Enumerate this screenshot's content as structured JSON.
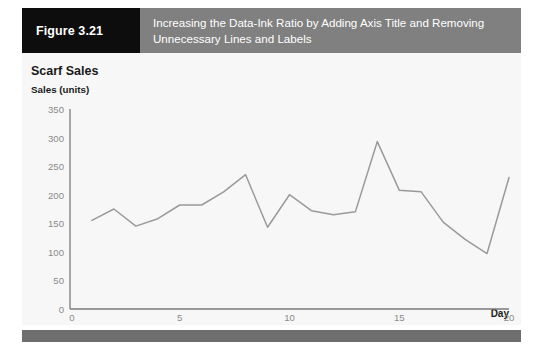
{
  "figure": {
    "number_label": "Figure 3.21",
    "caption": "Increasing the Data-Ink Ratio by Adding Axis Title and Removing Unnecessary Lines and Labels"
  },
  "colors": {
    "figure_number_bg": "#0d0d0d",
    "caption_bg": "#808080",
    "caption_text": "#ffffff",
    "panel_bg": "#f7f7f7",
    "line_series": "#9a9a9a",
    "axis": "#7a7a7a",
    "tick_text": "#8a8a8a",
    "footer_bar": "#6e6e6e"
  },
  "chart_data": {
    "type": "line",
    "title": "Scarf Sales",
    "xlabel": "Day",
    "ylabel": "Sales (units)",
    "x": [
      1,
      2,
      3,
      4,
      5,
      6,
      7,
      8,
      9,
      10,
      11,
      12,
      13,
      14,
      15,
      16,
      17,
      18,
      19,
      20
    ],
    "values": [
      155,
      175,
      145,
      158,
      182,
      182,
      205,
      235,
      143,
      200,
      172,
      165,
      170,
      293,
      208,
      205,
      152,
      122,
      97,
      230
    ],
    "series": [
      {
        "name": "Scarf Sales",
        "values": [
          155,
          175,
          145,
          158,
          182,
          182,
          205,
          235,
          143,
          200,
          172,
          165,
          170,
          293,
          208,
          205,
          152,
          122,
          97,
          230
        ]
      }
    ],
    "xlim": [
      0,
      20
    ],
    "ylim": [
      0,
      350
    ],
    "xticks": [
      0,
      5,
      10,
      15,
      20
    ],
    "yticks": [
      0,
      50,
      100,
      150,
      200,
      250,
      300,
      350
    ],
    "xtick_labels": [
      "0",
      "5",
      "10",
      "15",
      "20"
    ],
    "ytick_labels": [
      "0",
      "50",
      "100",
      "150",
      "200",
      "250",
      "300",
      "350"
    ],
    "grid": false,
    "legend": false,
    "origin_label": "0"
  }
}
